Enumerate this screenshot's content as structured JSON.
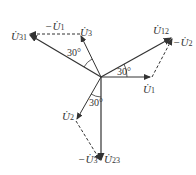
{
  "diagram": {
    "type": "phasor-diagram",
    "origin": [
      101,
      77
    ],
    "phasors": [
      {
        "id": "U1",
        "label": "U",
        "sub": "1",
        "tip": [
          152,
          77
        ],
        "style": "solid"
      },
      {
        "id": "U2",
        "label": "U",
        "sub": "2",
        "tip": [
          76,
          121
        ],
        "style": "solid"
      },
      {
        "id": "U3",
        "label": "U",
        "sub": "3",
        "tip": [
          80,
          34
        ],
        "style": "solid"
      },
      {
        "id": "U12",
        "label": "U",
        "sub": "12",
        "tip": [
          173,
          37
        ],
        "style": "solid"
      },
      {
        "id": "U23",
        "label": "U",
        "sub": "23",
        "tip": [
          101,
          162
        ],
        "style": "solid"
      },
      {
        "id": "U31",
        "label": "U",
        "sub": "31",
        "tip": [
          28,
          34
        ],
        "style": "solid"
      }
    ],
    "dashed": [
      {
        "id": "neg-U1",
        "label": "-U",
        "sub": "1",
        "from": [
          80,
          34
        ],
        "to": [
          28,
          34
        ]
      },
      {
        "id": "neg-U2",
        "label": "-U",
        "sub": "2",
        "from": [
          152,
          77
        ],
        "to": [
          173,
          37
        ]
      },
      {
        "id": "neg-U3",
        "label": "-U",
        "sub": "3",
        "from": [
          76,
          121
        ],
        "to": [
          101,
          162
        ]
      }
    ],
    "angles": [
      {
        "id": "angle-12",
        "text": "30°"
      },
      {
        "id": "angle-31",
        "text": "30°"
      },
      {
        "id": "angle-23",
        "text": "30°"
      }
    ]
  }
}
